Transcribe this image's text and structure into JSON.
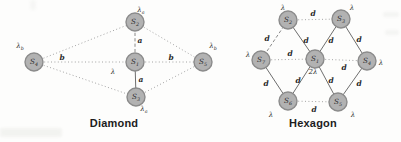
{
  "figure": {
    "background_color": "#fdfdfc",
    "node_fill_color": "#b2b2b2",
    "node_border_color": "#8b8b8b",
    "label_color": "#2a2a2a"
  },
  "diagrams": [
    {
      "id": "diamond",
      "caption": "Diamond",
      "nodes": [
        {
          "id": "S1",
          "base": "S",
          "sub": "1",
          "x": 135,
          "y": 62
        },
        {
          "id": "S2",
          "base": "S",
          "sub": "2",
          "x": 135,
          "y": 22
        },
        {
          "id": "S3",
          "base": "S",
          "sub": "3",
          "x": 136,
          "y": 97
        },
        {
          "id": "S4",
          "base": "S",
          "sub": "4",
          "x": 34,
          "y": 62
        },
        {
          "id": "S5",
          "base": "S",
          "sub": "5",
          "x": 203,
          "y": 62
        }
      ],
      "rate_labels": [
        {
          "node": "S2",
          "base": "λ",
          "sub": "a",
          "x": 141,
          "y": 12
        },
        {
          "node": "S4",
          "base": "λ",
          "sub": "b",
          "x": 20,
          "y": 48
        },
        {
          "node": "S1",
          "base": "λ",
          "sub": "",
          "x": 113,
          "y": 74
        },
        {
          "node": "S3",
          "base": "λ",
          "sub": "a",
          "x": 144,
          "y": 111
        },
        {
          "node": "S5",
          "base": "λ",
          "sub": "b",
          "x": 213,
          "y": 48
        }
      ],
      "edges": [
        {
          "from": "S4",
          "to": "S2",
          "style": "dotted",
          "label": "",
          "lx": 0,
          "ly": 0
        },
        {
          "from": "S2",
          "to": "S5",
          "style": "dotted",
          "label": "",
          "lx": 0,
          "ly": 0
        },
        {
          "from": "S4",
          "to": "S3",
          "style": "dotted",
          "label": "",
          "lx": 0,
          "ly": 0
        },
        {
          "from": "S3",
          "to": "S5",
          "style": "dotted",
          "label": "",
          "lx": 0,
          "ly": 0
        },
        {
          "from": "S4",
          "to": "S1",
          "style": "dotted",
          "label": "b",
          "lx": 62,
          "ly": 60
        },
        {
          "from": "S1",
          "to": "S5",
          "style": "dotted",
          "label": "b",
          "lx": 171,
          "ly": 60
        },
        {
          "from": "S2",
          "to": "S1",
          "style": "dashed",
          "label": "a",
          "lx": 140,
          "ly": 43
        },
        {
          "from": "S1",
          "to": "S3",
          "style": "solid",
          "label": "a",
          "lx": 141,
          "ly": 82
        }
      ]
    },
    {
      "id": "hexagon",
      "caption": "Hexagon",
      "nodes": [
        {
          "id": "S1",
          "base": "S",
          "sub": "1",
          "x": 315,
          "y": 59
        },
        {
          "id": "S2",
          "base": "S",
          "sub": "2",
          "x": 288,
          "y": 20
        },
        {
          "id": "S3",
          "base": "S",
          "sub": "3",
          "x": 341,
          "y": 19
        },
        {
          "id": "S4",
          "base": "S",
          "sub": "4",
          "x": 367,
          "y": 61
        },
        {
          "id": "S5",
          "base": "S",
          "sub": "5",
          "x": 338,
          "y": 102
        },
        {
          "id": "S6",
          "base": "S",
          "sub": "6",
          "x": 288,
          "y": 101
        },
        {
          "id": "S7",
          "base": "S",
          "sub": "7",
          "x": 261,
          "y": 60
        }
      ],
      "rate_labels": [
        {
          "node": "S2",
          "base": "λ",
          "sub": "",
          "x": 283,
          "y": 10
        },
        {
          "node": "S3",
          "base": "λ",
          "sub": "",
          "x": 352,
          "y": 10
        },
        {
          "node": "S4",
          "base": "λ",
          "sub": "",
          "x": 381,
          "y": 65
        },
        {
          "node": "S5",
          "base": "λ",
          "sub": "",
          "x": 353,
          "y": 117
        },
        {
          "node": "S6",
          "base": "λ",
          "sub": "",
          "x": 271,
          "y": 117
        },
        {
          "node": "S7",
          "base": "λ",
          "sub": "",
          "x": 248,
          "y": 57
        },
        {
          "node": "S1",
          "base": "2λ",
          "sub": "",
          "x": 313,
          "y": 74
        }
      ],
      "edges": [
        {
          "from": "S2",
          "to": "S3",
          "style": "dotted",
          "label": "d",
          "lx": 313,
          "ly": 16
        },
        {
          "from": "S7",
          "to": "S2",
          "style": "dashed",
          "label": "d",
          "lx": 267,
          "ly": 41
        },
        {
          "from": "S2",
          "to": "S1",
          "style": "solid",
          "label": "d",
          "lx": 306,
          "ly": 43
        },
        {
          "from": "S3",
          "to": "S1",
          "style": "solid",
          "label": "d",
          "lx": 331,
          "ly": 43
        },
        {
          "from": "S3",
          "to": "S4",
          "style": "solid",
          "label": "d",
          "lx": 359,
          "ly": 42
        },
        {
          "from": "S7",
          "to": "S1",
          "style": "dotted",
          "label": "d",
          "lx": 290,
          "ly": 56
        },
        {
          "from": "S1",
          "to": "S4",
          "style": "dotted",
          "label": "d",
          "lx": 344,
          "ly": 70
        },
        {
          "from": "S7",
          "to": "S6",
          "style": "solid",
          "label": "d",
          "lx": 266,
          "ly": 86
        },
        {
          "from": "S1",
          "to": "S6",
          "style": "solid",
          "label": "d",
          "lx": 298,
          "ly": 83
        },
        {
          "from": "S1",
          "to": "S5",
          "style": "solid",
          "label": "d",
          "lx": 331,
          "ly": 83
        },
        {
          "from": "S4",
          "to": "S5",
          "style": "solid",
          "label": "d",
          "lx": 359,
          "ly": 86
        },
        {
          "from": "S6",
          "to": "S5",
          "style": "dotted",
          "label": "d",
          "lx": 314,
          "ly": 112
        }
      ]
    }
  ]
}
